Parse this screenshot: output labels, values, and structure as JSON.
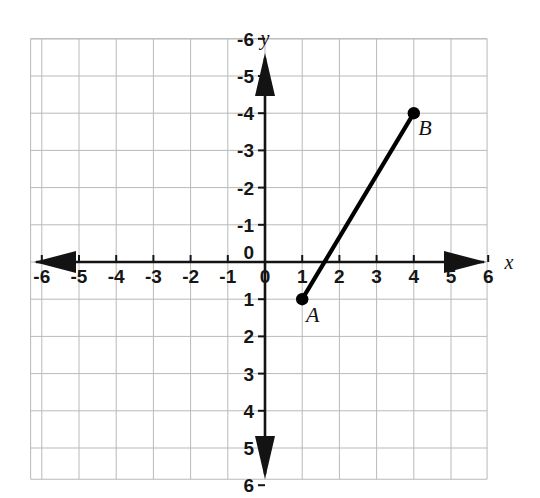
{
  "figure": {
    "kind": "coordinate-plane-line-segment",
    "background_color": "#ffffff",
    "grid_color": "#b9b9b9",
    "axis_color": "#131313",
    "segment_color": "#000000"
  },
  "axes": {
    "x_label": "x",
    "y_label": "y",
    "origin_label": "0",
    "x_ticks": [
      "-6",
      "-5",
      "-4",
      "-3",
      "-2",
      "-1",
      "0",
      "1",
      "2",
      "3",
      "4",
      "5",
      "6"
    ],
    "y_ticks": [
      "6",
      "5",
      "4",
      "3",
      "2",
      "1",
      "0",
      "-1",
      "-2",
      "-3",
      "-4",
      "-5",
      "-6"
    ]
  },
  "chart_data": {
    "type": "line",
    "title": "",
    "xlabel": "x",
    "ylabel": "y",
    "xlim": [
      -6.5,
      6.5
    ],
    "ylim": [
      -6.5,
      6.5
    ],
    "x_ticks": [
      -6,
      -5,
      -4,
      -3,
      -2,
      -1,
      0,
      1,
      2,
      3,
      4,
      5,
      6
    ],
    "y_ticks": [
      -6,
      -5,
      -4,
      -3,
      -2,
      -1,
      0,
      1,
      2,
      3,
      4,
      5,
      6
    ],
    "grid": true,
    "grid_step": 1,
    "legend": null,
    "series": [
      {
        "name": "segment AB",
        "x": [
          1,
          4
        ],
        "y": [
          -1,
          4
        ],
        "markers": true,
        "marker_style": "filled-circle",
        "color": "#000000"
      }
    ],
    "annotations": [
      {
        "label": "A",
        "x": 1,
        "y": -1,
        "dx": 0.28,
        "dy": -0.62
      },
      {
        "label": "B",
        "x": 4,
        "y": 4,
        "dx": 0.3,
        "dy": -0.58
      }
    ]
  },
  "points": {
    "A": {
      "label": "A",
      "x": 1,
      "y": -1
    },
    "B": {
      "label": "B",
      "x": 4,
      "y": 4
    }
  }
}
